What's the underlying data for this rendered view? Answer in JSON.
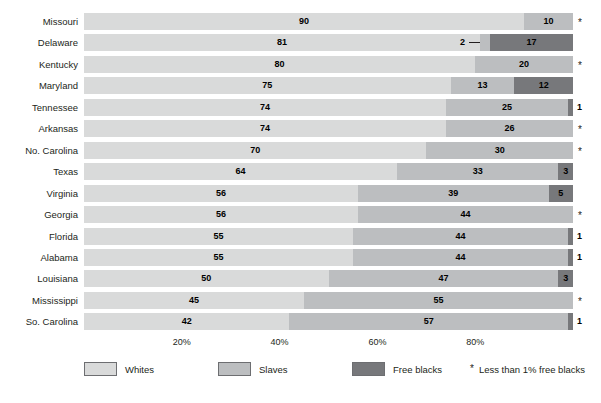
{
  "chart_data": {
    "type": "bar",
    "subtype": "stacked-horizontal-100",
    "title": "",
    "xlabel": "",
    "ylabel": "",
    "xlim": [
      0,
      100
    ],
    "grid": false,
    "legend_position": "bottom",
    "categories": [
      "Missouri",
      "Delaware",
      "Kentucky",
      "Maryland",
      "Tennessee",
      "Arkansas",
      "No. Carolina",
      "Texas",
      "Virginia",
      "Georgia",
      "Florida",
      "Alabama",
      "Louisiana",
      "Mississippi",
      "So. Carolina"
    ],
    "series": [
      {
        "name": "Whites",
        "color": "#d9dada",
        "values": [
          90,
          81,
          80,
          75,
          74,
          74,
          70,
          64,
          56,
          56,
          55,
          55,
          50,
          45,
          42
        ]
      },
      {
        "name": "Slaves",
        "color": "#bcbec0",
        "values": [
          10,
          2,
          20,
          13,
          25,
          26,
          30,
          33,
          39,
          44,
          44,
          44,
          47,
          55,
          57
        ]
      },
      {
        "name": "Free blacks",
        "color": "#77787b",
        "values": [
          0,
          17,
          0,
          12,
          1,
          0,
          0,
          3,
          5,
          0,
          1,
          1,
          3,
          0,
          1
        ]
      }
    ],
    "xticks": [
      20,
      40,
      60,
      80
    ],
    "xtick_labels": [
      "20%",
      "40%",
      "60%",
      "80%"
    ],
    "rows": [
      {
        "state": "Missouri",
        "whites": "90",
        "slaves": "10",
        "free": "",
        "marker": "*"
      },
      {
        "state": "Delaware",
        "whites": "81",
        "slaves": "2",
        "free": "17",
        "marker": ""
      },
      {
        "state": "Kentucky",
        "whites": "80",
        "slaves": "20",
        "free": "",
        "marker": "*"
      },
      {
        "state": "Maryland",
        "whites": "75",
        "slaves": "13",
        "free": "12",
        "marker": ""
      },
      {
        "state": "Tennessee",
        "whites": "74",
        "slaves": "25",
        "free": "1",
        "marker": ""
      },
      {
        "state": "Arkansas",
        "whites": "74",
        "slaves": "26",
        "free": "",
        "marker": "*"
      },
      {
        "state": "No. Carolina",
        "whites": "70",
        "slaves": "30",
        "free": "",
        "marker": "*"
      },
      {
        "state": "Texas",
        "whites": "64",
        "slaves": "33",
        "free": "3",
        "marker": ""
      },
      {
        "state": "Virginia",
        "whites": "56",
        "slaves": "39",
        "free": "5",
        "marker": ""
      },
      {
        "state": "Georgia",
        "whites": "56",
        "slaves": "44",
        "free": "",
        "marker": "*"
      },
      {
        "state": "Florida",
        "whites": "55",
        "slaves": "44",
        "free": "1",
        "marker": ""
      },
      {
        "state": "Alabama",
        "whites": "55",
        "slaves": "44",
        "free": "1",
        "marker": ""
      },
      {
        "state": "Louisiana",
        "whites": "50",
        "slaves": "47",
        "free": "3",
        "marker": ""
      },
      {
        "state": "Mississippi",
        "whites": "45",
        "slaves": "55",
        "free": "",
        "marker": "*"
      },
      {
        "state": "So. Carolina",
        "whites": "42",
        "slaves": "57",
        "free": "1",
        "marker": ""
      }
    ]
  },
  "legend": {
    "items": [
      {
        "label": "Whites",
        "color": "#d9dada"
      },
      {
        "label": "Slaves",
        "color": "#bcbec0"
      },
      {
        "label": "Free blacks",
        "color": "#77787b"
      }
    ],
    "note_symbol": "*",
    "note_text": "Less than 1% free blacks"
  }
}
